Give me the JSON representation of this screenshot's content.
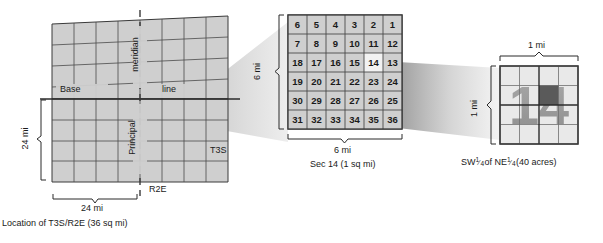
{
  "figure": {
    "panels": [
      "township-grid-location",
      "section-grid",
      "quarter-quarter-grid"
    ]
  },
  "left_panel": {
    "name": "Location of T3S/R2E",
    "grid_cols": 8,
    "grid_rows": 8,
    "labels": {
      "base": "Base",
      "line": "line",
      "principal": "Principal",
      "meridian": "meridian",
      "range": "R2E",
      "township": "T3S",
      "width_dim": "24 mi",
      "height_dim": "24 mi"
    },
    "caption": "Location of T3S/R2E (36 sq mi)"
  },
  "middle_panel": {
    "name": "Section grid of township T3S/R2E",
    "grid_cols": 6,
    "grid_rows": 6,
    "sections": [
      [
        6,
        5,
        4,
        3,
        2,
        1
      ],
      [
        7,
        8,
        9,
        10,
        11,
        12
      ],
      [
        18,
        17,
        16,
        15,
        14,
        13
      ],
      [
        19,
        20,
        21,
        22,
        23,
        24
      ],
      [
        30,
        29,
        28,
        27,
        26,
        25
      ],
      [
        31,
        32,
        33,
        34,
        35,
        36
      ]
    ],
    "highlighted_section": 14,
    "highlighted_row": 2,
    "highlighted_col": 4,
    "labels": {
      "width_dim": "6 mi",
      "height_dim": "6 mi"
    },
    "caption_line1": "6 mi",
    "caption_line2": "Sec 14 (1 sq mi)"
  },
  "right_panel": {
    "name": "Quarter-quarter subdivision of Section 14",
    "grid_cols": 4,
    "grid_rows": 4,
    "watermark": "14",
    "highlighted_row": 1,
    "highlighted_col": 2,
    "labels": {
      "width_dim": "1 mi",
      "height_dim": "1 mi"
    },
    "caption_prefix": "SW ",
    "caption_frac1_num": "1",
    "caption_frac1_den": "4",
    "caption_mid": " of NE ",
    "caption_frac2_num": "1",
    "caption_frac2_den": "4",
    "caption_suffix": " (40 acres)"
  },
  "colors": {
    "cell_fill": "#cfcfcf",
    "cell_fill_light": "#e9e9e9",
    "cell_highlight": "#f2f2f2",
    "cell_dark": "#5a5a5a",
    "stroke": "#3a3a3a",
    "stroke_light": "#6e6e6e",
    "cone": "#bdbdbd",
    "text": "#1a1a1a",
    "watermark": "#9a9a9a",
    "background": "#ffffff"
  }
}
